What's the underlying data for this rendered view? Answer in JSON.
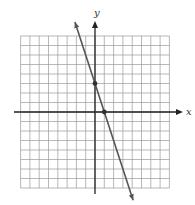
{
  "chart_data": {
    "type": "line",
    "title": "",
    "xlabel": "x",
    "ylabel": "y",
    "xlim": [
      -8,
      8
    ],
    "ylim": [
      -8,
      8
    ],
    "grid": true,
    "grid_step": 1,
    "series": [
      {
        "name": "y = -3x + 3",
        "slope": -3,
        "intercept": 3,
        "x": [
          -2.16,
          4.1
        ],
        "y": [
          9.48,
          -9.3
        ],
        "arrows": "both"
      }
    ],
    "points": [
      {
        "x": 0,
        "y": 3
      },
      {
        "x": 1,
        "y": 0
      }
    ]
  },
  "labels": {
    "x_axis": "x",
    "y_axis": "y"
  },
  "colors": {
    "grid": "#9a9a9a",
    "axis": "#222222",
    "line": "#555555",
    "point": "#333333"
  }
}
